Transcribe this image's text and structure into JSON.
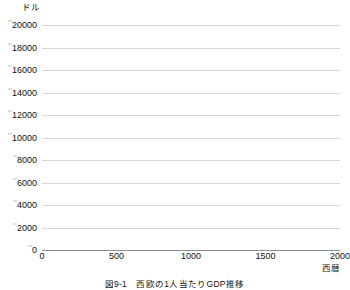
{
  "figure": {
    "caption": "図9-1　西欧の1人当たりGDP推移"
  },
  "chart_data": {
    "type": "line",
    "title": "",
    "subtitle": "",
    "xlabel": "西暦",
    "ylabel": "ドル",
    "y_unit_label": "ドル",
    "x_unit_label": "西暦",
    "xlim": [
      0,
      2000
    ],
    "ylim": [
      0,
      20000
    ],
    "grid": true,
    "legend": "none",
    "x_ticks": [
      0,
      500,
      1000,
      1500,
      2000
    ],
    "x_tick_labels": [
      "0",
      "500",
      "1000",
      "1500",
      "2000"
    ],
    "y_ticks": [
      0,
      2000,
      4000,
      6000,
      8000,
      10000,
      12000,
      14000,
      16000,
      18000,
      20000
    ],
    "y_tick_labels": [
      "0",
      "2000",
      "4000",
      "6000",
      "8000",
      "10000",
      "12000",
      "14000",
      "16000",
      "18000",
      "20000"
    ],
    "line_color": "#1a1a1a",
    "grid_color": "#d6d6d6",
    "axis_color": "#8e8e8e",
    "series": [
      {
        "name": "西欧の1人当たりGDP",
        "x": [
          0,
          100,
          200,
          300,
          400,
          500,
          600,
          700,
          800,
          900,
          1000,
          1100,
          1200,
          1300,
          1400,
          1500,
          1600,
          1700,
          1750,
          1800,
          1820,
          1850,
          1870,
          1900,
          1913,
          1930,
          1950,
          1960,
          1970,
          1980,
          1990,
          1998,
          2000
        ],
        "y": [
          450,
          440,
          435,
          430,
          425,
          420,
          415,
          410,
          408,
          410,
          420,
          440,
          480,
          520,
          560,
          620,
          720,
          880,
          980,
          1100,
          1200,
          1600,
          2000,
          2900,
          3500,
          4100,
          4600,
          7000,
          10500,
          13800,
          16500,
          18500,
          19000
        ]
      }
    ]
  }
}
